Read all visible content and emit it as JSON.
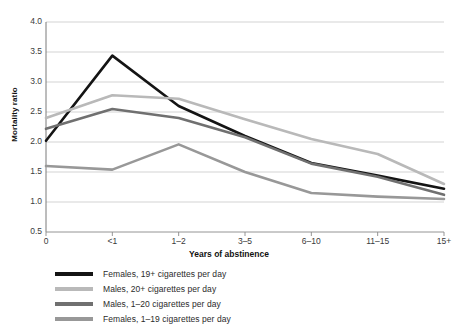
{
  "chart_data": {
    "type": "line",
    "title": "",
    "xlabel": "Years of abstinence",
    "ylabel": "Mortality ratio",
    "categories": [
      "0",
      "<1",
      "1–2",
      "3–5",
      "6–10",
      "11–15",
      "15+"
    ],
    "ylim": [
      0.5,
      4.0
    ],
    "yticks": [
      "0.5",
      "1.0",
      "1.5",
      "2.0",
      "2.5",
      "3.0",
      "3.5",
      "4.0"
    ],
    "ytick_values": [
      0.5,
      1.0,
      1.5,
      2.0,
      2.5,
      3.0,
      3.5,
      4.0
    ],
    "grid": true,
    "legend_position": "below",
    "series": [
      {
        "name": "Females, 19+ cigarettes per day",
        "color": "#141414",
        "values": [
          2.02,
          3.44,
          2.6,
          2.1,
          1.65,
          1.44,
          1.22
        ]
      },
      {
        "name": "Males, 20+ cigarettes per day",
        "color": "#b9b9b9",
        "values": [
          2.4,
          2.78,
          2.72,
          2.38,
          2.05,
          1.8,
          1.3
        ]
      },
      {
        "name": "Males, 1–20 cigarettes per day",
        "color": "#707070",
        "values": [
          2.22,
          2.55,
          2.4,
          2.08,
          1.64,
          1.42,
          1.12
        ]
      },
      {
        "name": "Females, 1–19 cigarettes per day",
        "color": "#989898",
        "values": [
          1.6,
          1.54,
          1.96,
          1.5,
          1.15,
          1.09,
          1.05
        ]
      }
    ]
  },
  "axes": {
    "y_title": "Mortality ratio",
    "x_title": "Years of abstinence"
  }
}
